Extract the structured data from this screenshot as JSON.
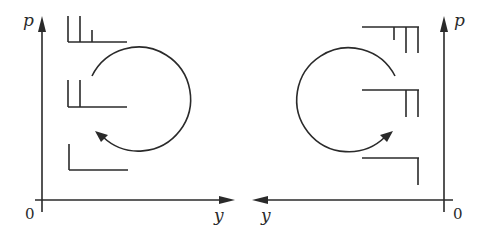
{
  "diagram": {
    "stroke_color": "#2a2a2a",
    "background": "#ffffff",
    "panels": [
      {
        "id": "left",
        "axes": {
          "vertical_label": "p",
          "horizontal_label": "y",
          "origin_label": "0",
          "horizontal_direction": "right"
        },
        "glyphs": [
          {
            "position": "top",
            "ticks": 3
          },
          {
            "position": "middle",
            "ticks": 2
          },
          {
            "position": "bottom",
            "ticks": 1
          }
        ],
        "rotation": "clockwise"
      },
      {
        "id": "right",
        "axes": {
          "vertical_label": "p",
          "horizontal_label": "y",
          "origin_label": "0",
          "horizontal_direction": "left"
        },
        "glyphs": [
          {
            "position": "top",
            "ticks": 3
          },
          {
            "position": "middle",
            "ticks": 2
          },
          {
            "position": "bottom",
            "ticks": 1
          }
        ],
        "rotation": "counterclockwise"
      }
    ]
  }
}
